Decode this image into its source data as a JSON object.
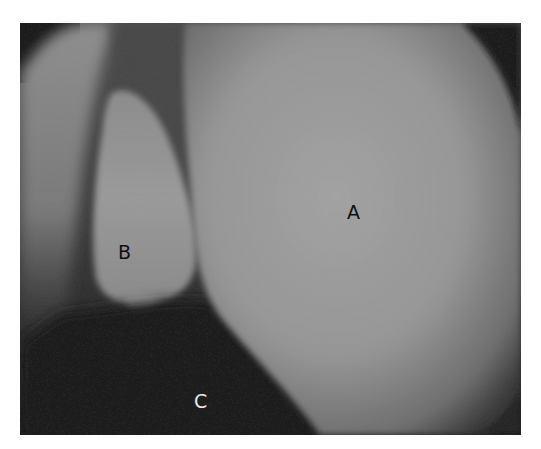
{
  "image": {
    "description": "Grayscale endoscopic photograph with three anatomical structures labelled",
    "colors": {
      "background": "#ffffff",
      "structure_light": "#9a9a9a",
      "structure_mid": "#7e7e7e",
      "shadow": "#1e1e1e"
    }
  },
  "labels": [
    {
      "id": "A",
      "text": "A",
      "x": 347,
      "y": 203,
      "color": "dark"
    },
    {
      "id": "B",
      "text": "B",
      "x": 118,
      "y": 243,
      "color": "dark"
    },
    {
      "id": "C",
      "text": "C",
      "x": 194,
      "y": 392,
      "color": "light"
    }
  ]
}
